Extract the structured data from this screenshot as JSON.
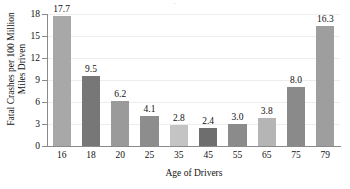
{
  "chart_data": {
    "type": "bar",
    "title": "",
    "xlabel": "Age of Drivers",
    "ylabel_line1": "Fatal Crashes per 100 Million",
    "ylabel_line2": "Miles Driven",
    "categories": [
      "16",
      "18",
      "20",
      "25",
      "35",
      "45",
      "55",
      "65",
      "75",
      "79"
    ],
    "values": [
      17.7,
      9.5,
      6.2,
      4.1,
      2.8,
      2.4,
      3.0,
      3.8,
      8.0,
      16.3
    ],
    "value_labels": [
      "17.7",
      "9.5",
      "6.2",
      "4.1",
      "2.8",
      "2.4",
      "3.0",
      "3.8",
      "8.0",
      "16.3"
    ],
    "bar_colors": [
      "#a8a8a8",
      "#777777",
      "#9a9a9a",
      "#8d8d8d",
      "#c4c4c4",
      "#6e6e6e",
      "#8b8b8b",
      "#b5b5b5",
      "#8a8a8a",
      "#9e9e9e"
    ],
    "yticks": [
      0,
      3,
      6,
      9,
      12,
      15,
      18
    ],
    "ytick_labels": [
      "0",
      "3",
      "6",
      "9",
      "12",
      "15",
      "18"
    ],
    "ylim": [
      0,
      18
    ],
    "grid": true,
    "grid_color": "#ededed",
    "axis_color": "#8a8a8a",
    "legend": "none",
    "title_remnant": "·"
  }
}
